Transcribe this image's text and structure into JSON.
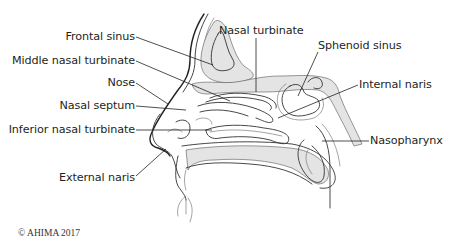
{
  "figure": {
    "labels": {
      "frontal_sinus": "Frontal sinus",
      "middle_nasal_turbinate": "Middle nasal turbinate",
      "nose": "Nose",
      "nasal_septum": "Nasal septum",
      "inferior_nasal_turbinate": "Inferior nasal turbinate",
      "external_naris": "External naris",
      "nasal_turbinate": "Nasal turbinate",
      "sphenoid_sinus": "Sphenoid sinus",
      "internal_naris": "Internal naris",
      "nasopharynx": "Nasopharynx"
    },
    "copyright": "© AHIMA 2017"
  },
  "colors": {
    "text": "#231f20",
    "line": "#333333",
    "bone_fill": "#e4e4e4",
    "background": "#ffffff"
  }
}
